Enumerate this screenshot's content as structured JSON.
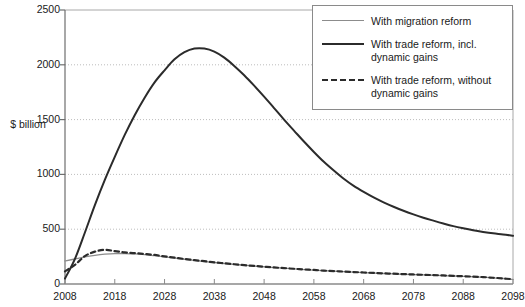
{
  "chart_data": {
    "type": "line",
    "title": "",
    "subtitle": "",
    "xlabel": "",
    "ylabel": "$\nbillion",
    "ylabel_lines": [
      "$",
      "billion"
    ],
    "xlim": [
      2008,
      2098
    ],
    "ylim": [
      0,
      2500
    ],
    "ytick_labels": [
      "0",
      "500",
      "1000",
      "1500",
      "2000",
      "2500"
    ],
    "ytick_values": [
      0,
      500,
      1000,
      1500,
      2000,
      2500
    ],
    "xtick_labels": [
      "2008",
      "2018",
      "2028",
      "2038",
      "2048",
      "2058",
      "2068",
      "2078",
      "2088",
      "2098"
    ],
    "xtick_values": [
      2008,
      2018,
      2028,
      2038,
      2048,
      2058,
      2068,
      2078,
      2088,
      2098
    ],
    "grid": "horizontal-dotted",
    "legend_position": "top-right",
    "x": [
      2008,
      2010,
      2012,
      2014,
      2016,
      2018,
      2020,
      2022,
      2024,
      2026,
      2028,
      2030,
      2032,
      2034,
      2036,
      2038,
      2040,
      2042,
      2044,
      2046,
      2048,
      2050,
      2052,
      2054,
      2056,
      2058,
      2060,
      2062,
      2064,
      2066,
      2068,
      2070,
      2072,
      2074,
      2076,
      2078,
      2080,
      2082,
      2084,
      2086,
      2088,
      2090,
      2092,
      2094,
      2096,
      2098
    ],
    "series": [
      {
        "name": "With migration reform",
        "style": "solid-thin-grey",
        "color": "#8c8c8c",
        "values": [
          210,
          228,
          248,
          262,
          272,
          278,
          278,
          275,
          268,
          258,
          248,
          237,
          226,
          215,
          205,
          196,
          187,
          179,
          171,
          164,
          157,
          150,
          144,
          138,
          132,
          127,
          121,
          117,
          112,
          108,
          104,
          100,
          96,
          93,
          89,
          86,
          83,
          80,
          77,
          73,
          70,
          66,
          62,
          56,
          50,
          42
        ]
      },
      {
        "name": "With trade reform, incl. dynamic gains",
        "style": "solid-thick-black",
        "color": "#2b2b2b",
        "values": [
          50,
          230,
          470,
          720,
          950,
          1160,
          1360,
          1540,
          1700,
          1840,
          1950,
          2050,
          2115,
          2148,
          2148,
          2120,
          2065,
          1990,
          1905,
          1810,
          1710,
          1605,
          1500,
          1400,
          1300,
          1205,
          1115,
          1035,
          960,
          895,
          840,
          790,
          745,
          705,
          668,
          635,
          605,
          578,
          552,
          528,
          508,
          490,
          475,
          462,
          452,
          440
        ]
      },
      {
        "name": "With trade reform, without dynamic gains",
        "style": "dashed-black",
        "color": "#2b2b2b",
        "values": [
          115,
          175,
          255,
          295,
          312,
          300,
          288,
          282,
          274,
          265,
          252,
          240,
          228,
          218,
          208,
          198,
          189,
          180,
          172,
          165,
          158,
          151,
          145,
          139,
          133,
          128,
          122,
          118,
          113,
          109,
          105,
          101,
          97,
          94,
          90,
          87,
          84,
          81,
          78,
          74,
          71,
          67,
          63,
          57,
          51,
          43
        ]
      }
    ]
  },
  "legend": {
    "items": [
      {
        "label": "With migration reform",
        "swatch": "thin-grey-line"
      },
      {
        "label": "With trade reform, incl.\ndynamic gains",
        "swatch": "thick-black-line"
      },
      {
        "label": "With trade reform, without\ndynamic gains",
        "swatch": "dashed-black-line"
      }
    ]
  }
}
